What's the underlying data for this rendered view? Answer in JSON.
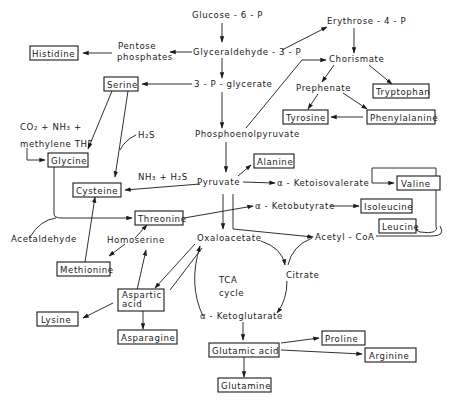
{
  "diagram": {
    "metabolites": {
      "glucose6p": "Glucose - 6 - P",
      "erythrose4p": "Erythrose - 4 - P",
      "pentose_line1": "Pentose",
      "pentose_line2": "phosphates",
      "g3p": "Glyceraldehyde - 3 - P",
      "chorismate": "Chorismate",
      "p3g": "3 - P - glycerate",
      "prephenate": "Prephenate",
      "pep": "Phosphoenolpyruvate",
      "pyruvate": "Pyruvate",
      "ketoisovalerate": "α - Ketoisovalerate",
      "ketobutyrate": "α - Ketobutyrate",
      "acetylcoa": "Acetyl - CoA",
      "oxaloacetate": "Oxaloacetate",
      "citrate": "Citrate",
      "tca_line1": "TCA",
      "tca_line2": "cycle",
      "ketoglutarate": "α - Ketoglutarate",
      "homoserine": "Homoserine",
      "acetaldehyde": "Acetaldehyde"
    },
    "cofactors": {
      "co2_nh3": "CO₂ + NH₃ +",
      "methylene_thf": "methylene THF",
      "h2s": "H₂S",
      "nh3_h2s": "NH₃ + H₂S"
    },
    "amino_acids": {
      "histidine": "Histidine",
      "serine": "Serine",
      "tryptophan": "Tryptophan",
      "tyrosine": "Tyrosine",
      "phenylalanine": "Phenylalanine",
      "glycine": "Glycine",
      "alanine": "Alanine",
      "valine": "Valine",
      "cysteine": "Cysteine",
      "threonine": "Threonine",
      "isoleucine": "Isoleucine",
      "leucine": "Leucine",
      "methionine": "Methionine",
      "aspartic_line1": "Aspartic",
      "aspartic_line2": "acid",
      "lysine": "Lysine",
      "asparagine": "Asparagine",
      "glutamic": "Glutamic acid",
      "proline": "Proline",
      "arginine": "Arginine",
      "glutamine": "Glutamine"
    }
  }
}
